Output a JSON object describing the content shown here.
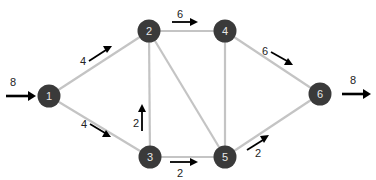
{
  "diagram": {
    "type": "flow-network",
    "nodes": [
      {
        "id": "1",
        "label": "1",
        "x": 49,
        "y": 96
      },
      {
        "id": "2",
        "label": "2",
        "x": 149,
        "y": 31
      },
      {
        "id": "3",
        "label": "3",
        "x": 150,
        "y": 157
      },
      {
        "id": "4",
        "label": "4",
        "x": 225,
        "y": 31
      },
      {
        "id": "5",
        "label": "5",
        "x": 225,
        "y": 157
      },
      {
        "id": "6",
        "label": "6",
        "x": 320,
        "y": 94
      }
    ],
    "edges": [
      {
        "from": "1",
        "to": "2",
        "flow": "4"
      },
      {
        "from": "1",
        "to": "3",
        "flow": "4"
      },
      {
        "from": "2",
        "to": "4",
        "flow": "6"
      },
      {
        "from": "2",
        "to": "3",
        "flow": ""
      },
      {
        "from": "2",
        "to": "5",
        "flow": ""
      },
      {
        "from": "3",
        "to": "2",
        "flow": "2"
      },
      {
        "from": "3",
        "to": "5",
        "flow": "2"
      },
      {
        "from": "4",
        "to": "5",
        "flow": ""
      },
      {
        "from": "4",
        "to": "6",
        "flow": "6"
      },
      {
        "from": "5",
        "to": "6",
        "flow": "2"
      }
    ],
    "source_inflow": "8",
    "sink_outflow": "8",
    "colors": {
      "node": "#3a3a3a",
      "edge": "#c4c4c4",
      "arrow": "#000000"
    }
  }
}
